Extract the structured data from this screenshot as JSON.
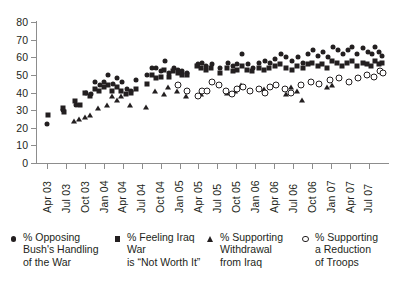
{
  "chart_data": {
    "type": "scatter",
    "title": "",
    "xlabel": "",
    "ylabel": "",
    "ylim": [
      0,
      80
    ],
    "ytick_step": 10,
    "grid": false,
    "legend_position": "bottom",
    "yticks": [
      "0",
      "10",
      "20",
      "30",
      "40",
      "50",
      "60",
      "70",
      "80"
    ],
    "categories": [
      "Apr 03",
      "Jul 03",
      "Oct 03",
      "Jan 04",
      "Apr 04",
      "Jul 04",
      "Oct 04",
      "Jan 05",
      "Apr 05",
      "Jul 05",
      "Oct 05",
      "Jan 06",
      "Apr 06",
      "Jul 06",
      "Oct 06",
      "Jan 07",
      "Apr 07",
      "Jul 07"
    ],
    "x_range": [
      "Apr 03",
      "Jul 07"
    ],
    "series": [
      {
        "name": "% Opposing Bush's Handling of the War",
        "marker": "circle-filled",
        "color": "#231f20",
        "points": [
          {
            "x": 0.02,
            "y": 22
          },
          {
            "x": 0.86,
            "y": 30
          },
          {
            "x": 1.52,
            "y": 33
          },
          {
            "x": 2.05,
            "y": 40
          },
          {
            "x": 2.3,
            "y": 39
          },
          {
            "x": 2.55,
            "y": 46
          },
          {
            "x": 2.78,
            "y": 44
          },
          {
            "x": 3.02,
            "y": 46
          },
          {
            "x": 3.22,
            "y": 50
          },
          {
            "x": 3.48,
            "y": 45
          },
          {
            "x": 3.72,
            "y": 48
          },
          {
            "x": 3.95,
            "y": 46
          },
          {
            "x": 4.2,
            "y": 42
          },
          {
            "x": 4.45,
            "y": 41
          },
          {
            "x": 4.72,
            "y": 47
          },
          {
            "x": 5.3,
            "y": 50
          },
          {
            "x": 5.55,
            "y": 54
          },
          {
            "x": 5.78,
            "y": 54
          },
          {
            "x": 6.02,
            "y": 52
          },
          {
            "x": 6.22,
            "y": 58
          },
          {
            "x": 6.45,
            "y": 51
          },
          {
            "x": 6.7,
            "y": 54
          },
          {
            "x": 6.92,
            "y": 53
          },
          {
            "x": 7.15,
            "y": 52
          },
          {
            "x": 7.4,
            "y": 51
          },
          {
            "x": 7.95,
            "y": 56
          },
          {
            "x": 8.18,
            "y": 57
          },
          {
            "x": 8.42,
            "y": 55
          },
          {
            "x": 8.7,
            "y": 56
          },
          {
            "x": 9.15,
            "y": 54
          },
          {
            "x": 9.55,
            "y": 57
          },
          {
            "x": 9.82,
            "y": 55
          },
          {
            "x": 10.05,
            "y": 56
          },
          {
            "x": 10.3,
            "y": 62
          },
          {
            "x": 10.6,
            "y": 56
          },
          {
            "x": 10.88,
            "y": 54
          },
          {
            "x": 11.2,
            "y": 57
          },
          {
            "x": 11.5,
            "y": 58
          },
          {
            "x": 11.78,
            "y": 57
          },
          {
            "x": 12.05,
            "y": 59
          },
          {
            "x": 12.35,
            "y": 62
          },
          {
            "x": 12.65,
            "y": 60
          },
          {
            "x": 12.95,
            "y": 58
          },
          {
            "x": 13.25,
            "y": 60
          },
          {
            "x": 13.55,
            "y": 57
          },
          {
            "x": 13.8,
            "y": 62
          },
          {
            "x": 14.05,
            "y": 64
          },
          {
            "x": 14.32,
            "y": 61
          },
          {
            "x": 14.58,
            "y": 63
          },
          {
            "x": 14.82,
            "y": 60
          },
          {
            "x": 15.1,
            "y": 66
          },
          {
            "x": 15.35,
            "y": 64
          },
          {
            "x": 15.62,
            "y": 62
          },
          {
            "x": 15.88,
            "y": 64
          },
          {
            "x": 16.12,
            "y": 66
          },
          {
            "x": 16.4,
            "y": 62
          },
          {
            "x": 16.7,
            "y": 65
          },
          {
            "x": 16.95,
            "y": 63
          },
          {
            "x": 17.15,
            "y": 62
          },
          {
            "x": 17.35,
            "y": 66
          },
          {
            "x": 17.55,
            "y": 63
          },
          {
            "x": 17.72,
            "y": 61
          }
        ]
      },
      {
        "name": "% Feeling Iraq War is \"Not Worth It\"",
        "marker": "square-filled",
        "color": "#231f20",
        "points": [
          {
            "x": 0.05,
            "y": 27
          },
          {
            "x": 0.82,
            "y": 31
          },
          {
            "x": 0.88,
            "y": 29
          },
          {
            "x": 1.48,
            "y": 35
          },
          {
            "x": 1.72,
            "y": 33
          },
          {
            "x": 2.02,
            "y": 40
          },
          {
            "x": 2.28,
            "y": 38
          },
          {
            "x": 2.52,
            "y": 42
          },
          {
            "x": 2.75,
            "y": 41
          },
          {
            "x": 3.0,
            "y": 43
          },
          {
            "x": 3.2,
            "y": 44
          },
          {
            "x": 3.45,
            "y": 41
          },
          {
            "x": 3.7,
            "y": 43
          },
          {
            "x": 3.92,
            "y": 41
          },
          {
            "x": 4.18,
            "y": 39
          },
          {
            "x": 4.42,
            "y": 40
          },
          {
            "x": 4.68,
            "y": 42
          },
          {
            "x": 5.28,
            "y": 45
          },
          {
            "x": 5.52,
            "y": 50
          },
          {
            "x": 5.75,
            "y": 48
          },
          {
            "x": 6.0,
            "y": 49
          },
          {
            "x": 6.2,
            "y": 53
          },
          {
            "x": 6.42,
            "y": 49
          },
          {
            "x": 6.68,
            "y": 52
          },
          {
            "x": 6.9,
            "y": 51
          },
          {
            "x": 7.12,
            "y": 50
          },
          {
            "x": 7.38,
            "y": 50
          },
          {
            "x": 7.92,
            "y": 55
          },
          {
            "x": 8.15,
            "y": 54
          },
          {
            "x": 8.4,
            "y": 53
          },
          {
            "x": 8.68,
            "y": 54
          },
          {
            "x": 9.12,
            "y": 51
          },
          {
            "x": 9.52,
            "y": 54
          },
          {
            "x": 9.8,
            "y": 52
          },
          {
            "x": 10.02,
            "y": 53
          },
          {
            "x": 10.28,
            "y": 55
          },
          {
            "x": 10.58,
            "y": 53
          },
          {
            "x": 10.85,
            "y": 52
          },
          {
            "x": 11.18,
            "y": 54
          },
          {
            "x": 11.48,
            "y": 53
          },
          {
            "x": 11.75,
            "y": 54
          },
          {
            "x": 12.02,
            "y": 55
          },
          {
            "x": 12.32,
            "y": 56
          },
          {
            "x": 12.62,
            "y": 54
          },
          {
            "x": 12.92,
            "y": 53
          },
          {
            "x": 13.22,
            "y": 55
          },
          {
            "x": 13.52,
            "y": 54
          },
          {
            "x": 13.78,
            "y": 56
          },
          {
            "x": 14.02,
            "y": 57
          },
          {
            "x": 14.3,
            "y": 55
          },
          {
            "x": 14.55,
            "y": 56
          },
          {
            "x": 14.8,
            "y": 54
          },
          {
            "x": 15.08,
            "y": 58
          },
          {
            "x": 15.32,
            "y": 57
          },
          {
            "x": 15.6,
            "y": 55
          },
          {
            "x": 15.85,
            "y": 57
          },
          {
            "x": 16.1,
            "y": 58
          },
          {
            "x": 16.38,
            "y": 55
          },
          {
            "x": 16.68,
            "y": 57
          },
          {
            "x": 16.92,
            "y": 56
          },
          {
            "x": 17.12,
            "y": 55
          },
          {
            "x": 17.32,
            "y": 58
          },
          {
            "x": 17.52,
            "y": 56
          },
          {
            "x": 17.7,
            "y": 57
          }
        ]
      },
      {
        "name": "% Supporting Withdrawal from Iraq",
        "marker": "triangle-filled",
        "color": "#231f20",
        "points": [
          {
            "x": 1.45,
            "y": 24
          },
          {
            "x": 1.7,
            "y": 25
          },
          {
            "x": 2.0,
            "y": 26
          },
          {
            "x": 2.25,
            "y": 27
          },
          {
            "x": 2.7,
            "y": 31
          },
          {
            "x": 3.18,
            "y": 33
          },
          {
            "x": 3.42,
            "y": 38
          },
          {
            "x": 3.68,
            "y": 36
          },
          {
            "x": 3.9,
            "y": 38
          },
          {
            "x": 4.4,
            "y": 33
          },
          {
            "x": 5.25,
            "y": 32
          },
          {
            "x": 5.72,
            "y": 41
          },
          {
            "x": 6.18,
            "y": 39
          },
          {
            "x": 6.4,
            "y": 43
          },
          {
            "x": 6.88,
            "y": 41
          },
          {
            "x": 7.35,
            "y": 38
          },
          {
            "x": 8.12,
            "y": 39
          },
          {
            "x": 9.5,
            "y": 40
          },
          {
            "x": 9.95,
            "y": 41
          },
          {
            "x": 10.25,
            "y": 44
          },
          {
            "x": 11.45,
            "y": 42
          },
          {
            "x": 12.6,
            "y": 39
          },
          {
            "x": 12.9,
            "y": 43
          },
          {
            "x": 13.2,
            "y": 41
          },
          {
            "x": 13.48,
            "y": 36
          },
          {
            "x": 14.8,
            "y": 43
          },
          {
            "x": 15.05,
            "y": 44
          }
        ]
      },
      {
        "name": "% Supporting a Reduction of Troops",
        "marker": "circle-open",
        "color": "#231f20",
        "points": [
          {
            "x": 6.92,
            "y": 44
          },
          {
            "x": 7.38,
            "y": 41
          },
          {
            "x": 7.95,
            "y": 38
          },
          {
            "x": 8.2,
            "y": 41
          },
          {
            "x": 8.45,
            "y": 41
          },
          {
            "x": 8.72,
            "y": 46
          },
          {
            "x": 9.1,
            "y": 44
          },
          {
            "x": 9.45,
            "y": 41
          },
          {
            "x": 9.78,
            "y": 39
          },
          {
            "x": 10.05,
            "y": 42
          },
          {
            "x": 10.35,
            "y": 43
          },
          {
            "x": 10.7,
            "y": 41
          },
          {
            "x": 11.2,
            "y": 42
          },
          {
            "x": 11.52,
            "y": 40
          },
          {
            "x": 11.8,
            "y": 43
          },
          {
            "x": 12.1,
            "y": 44
          },
          {
            "x": 12.55,
            "y": 42
          },
          {
            "x": 12.88,
            "y": 40
          },
          {
            "x": 13.42,
            "y": 44
          },
          {
            "x": 13.95,
            "y": 46
          },
          {
            "x": 14.35,
            "y": 45
          },
          {
            "x": 14.95,
            "y": 47
          },
          {
            "x": 15.45,
            "y": 48
          },
          {
            "x": 15.95,
            "y": 46
          },
          {
            "x": 16.45,
            "y": 48
          },
          {
            "x": 16.9,
            "y": 50
          },
          {
            "x": 17.3,
            "y": 49
          },
          {
            "x": 17.6,
            "y": 52
          },
          {
            "x": 17.75,
            "y": 51
          }
        ]
      }
    ]
  },
  "legend": {
    "items": [
      {
        "marker": "circle-filled",
        "lines": [
          "% Opposing",
          "Bush's Handling",
          "of the War"
        ]
      },
      {
        "marker": "square-filled",
        "lines": [
          "% Feeling Iraq War",
          "is “Not Worth It”"
        ]
      },
      {
        "marker": "triangle-filled",
        "lines": [
          "% Supporting",
          "Withdrawal",
          "from Iraq"
        ]
      },
      {
        "marker": "circle-open",
        "lines": [
          "% Supporting",
          "a Reduction",
          "of Troops"
        ]
      }
    ]
  }
}
